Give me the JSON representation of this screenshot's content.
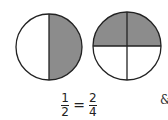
{
  "diagram": {
    "left_circle": {
      "label": "one-half",
      "parts": 2,
      "shaded": 1
    },
    "right_circle": {
      "label": "two-quarters",
      "parts": 4,
      "shaded": 2
    },
    "shade_color": "#8c8c8c",
    "stroke_color": "#222222"
  },
  "equation": {
    "left_num": "1",
    "left_den": "2",
    "equals": "=",
    "right_num": "2",
    "right_den": "4"
  },
  "edge_mark": "&"
}
